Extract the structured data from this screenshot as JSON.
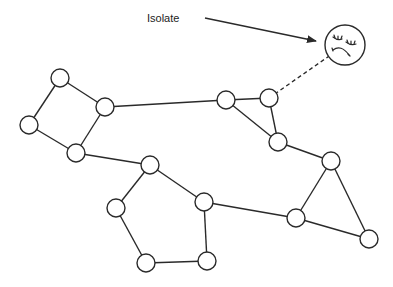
{
  "diagram": {
    "type": "network-graph",
    "annotation": {
      "label": "Isolate",
      "x": 167,
      "y": 22,
      "arrow": {
        "x1": 205,
        "y1": 18,
        "x2": 316,
        "y2": 41
      }
    },
    "isolate_node": {
      "id": "isolate",
      "cx": 345,
      "cy": 45,
      "r": 20,
      "icon": "sad-face-icon"
    },
    "nodes": [
      {
        "id": "A",
        "cx": 60,
        "cy": 78
      },
      {
        "id": "B",
        "cx": 105,
        "cy": 107
      },
      {
        "id": "C",
        "cx": 29,
        "cy": 125
      },
      {
        "id": "D",
        "cx": 76,
        "cy": 153
      },
      {
        "id": "E",
        "cx": 226,
        "cy": 100
      },
      {
        "id": "F",
        "cx": 269,
        "cy": 98
      },
      {
        "id": "G",
        "cx": 278,
        "cy": 142
      },
      {
        "id": "H",
        "cx": 331,
        "cy": 161
      },
      {
        "id": "I",
        "cx": 296,
        "cy": 218
      },
      {
        "id": "J",
        "cx": 369,
        "cy": 239
      },
      {
        "id": "K",
        "cx": 150,
        "cy": 165
      },
      {
        "id": "L",
        "cx": 204,
        "cy": 202
      },
      {
        "id": "M",
        "cx": 116,
        "cy": 208
      },
      {
        "id": "N",
        "cx": 146,
        "cy": 263
      },
      {
        "id": "O",
        "cx": 207,
        "cy": 261
      }
    ],
    "node_radius": 9,
    "edges": [
      [
        "A",
        "B"
      ],
      [
        "A",
        "C"
      ],
      [
        "C",
        "D"
      ],
      [
        "B",
        "D"
      ],
      [
        "B",
        "E"
      ],
      [
        "D",
        "K"
      ],
      [
        "E",
        "F"
      ],
      [
        "E",
        "G"
      ],
      [
        "F",
        "G"
      ],
      [
        "G",
        "H"
      ],
      [
        "H",
        "I"
      ],
      [
        "H",
        "J"
      ],
      [
        "I",
        "J"
      ],
      [
        "K",
        "L"
      ],
      [
        "K",
        "M"
      ],
      [
        "M",
        "N"
      ],
      [
        "N",
        "O"
      ],
      [
        "O",
        "L"
      ],
      [
        "L",
        "I"
      ]
    ],
    "dashed_edges": [
      [
        "F",
        "isolate"
      ]
    ],
    "colors": {
      "stroke": "#2a2a2a",
      "node_fill": "#ffffff",
      "background": "#ffffff"
    }
  }
}
